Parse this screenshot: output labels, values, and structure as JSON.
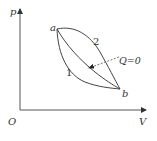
{
  "diagram": {
    "type": "p-V thermodynamic diagram",
    "axes": {
      "y_label": "p",
      "x_label": "V",
      "origin_label": "O"
    },
    "points": [
      {
        "id": "a",
        "label": "a"
      },
      {
        "id": "b",
        "label": "b"
      }
    ],
    "curves": [
      {
        "id": "curve-1",
        "label": "1",
        "description": "lower path from a to b"
      },
      {
        "id": "curve-2",
        "label": "2",
        "description": "upper path from a to b"
      },
      {
        "id": "adiabat",
        "label": "",
        "description": "middle adiabatic path from a to b"
      }
    ],
    "annotation": {
      "text": "Q=0",
      "target": "adiabat"
    },
    "colors": {
      "line": "#444444",
      "text": "#333333",
      "background": "#ffffff"
    }
  }
}
